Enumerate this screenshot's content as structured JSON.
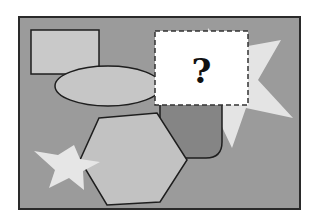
{
  "figure": {
    "question_box": {
      "label": "?"
    },
    "shapes": [
      {
        "name": "background-panel",
        "type": "rectangle"
      },
      {
        "name": "top-left-rectangle",
        "type": "rectangle"
      },
      {
        "name": "ellipse",
        "type": "ellipse"
      },
      {
        "name": "large-star",
        "type": "star"
      },
      {
        "name": "rounded-shape",
        "type": "rounded-rectangle"
      },
      {
        "name": "hexagon",
        "type": "hexagon"
      },
      {
        "name": "small-star",
        "type": "star"
      },
      {
        "name": "question-box",
        "type": "dashed-rectangle"
      }
    ],
    "colors": {
      "panel": "#9b9b9b",
      "rectangle": "#c9c9c9",
      "ellipse": "#c6c6c6",
      "large_star": "#e4e4e4",
      "rounded_shape": "#858585",
      "hexagon": "#c2c2c2",
      "small_star": "#e6e6e6",
      "outline": "#1e1e1e",
      "question_box": "#ffffff"
    }
  }
}
